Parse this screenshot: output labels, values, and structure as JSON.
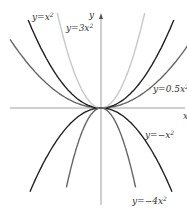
{
  "chart_data": {
    "type": "line",
    "title": "",
    "xlabel": "x",
    "ylabel": "y",
    "grid": false,
    "series": [
      {
        "name": "y=x^2",
        "label": "y=x",
        "coef": 1,
        "color": "#222222",
        "x_range": [
          -4,
          4
        ]
      },
      {
        "name": "y=3x^2",
        "label": "y=3x",
        "coef": 3,
        "color": "#c8c8c8",
        "x_range": [
          -2.4,
          2.4
        ]
      },
      {
        "name": "y=0.5x^2",
        "label": "y=0.5x",
        "coef": 0.5,
        "color": "#666666",
        "x_range": [
          -5,
          5
        ]
      },
      {
        "name": "y=-x^2",
        "label": "y=−x",
        "coef": -1,
        "color": "#222222",
        "x_range": [
          -3.9,
          3.9
        ]
      },
      {
        "name": "y=-4x^2",
        "label": "y=−4x",
        "coef": -4,
        "color": "#666666",
        "x_range": [
          -1.9,
          1.9
        ]
      }
    ],
    "sup": "2",
    "axis_x_label": "x",
    "axis_y_label": "y"
  }
}
